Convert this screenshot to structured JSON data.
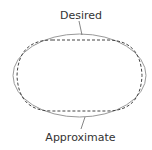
{
  "diagram": {
    "labels": {
      "desired": "Desired",
      "approximate": "Approximate"
    },
    "colors": {
      "desired_curve": "#999999",
      "approximate_curve": "#444444",
      "text": "#333333",
      "leader": "#666666"
    }
  }
}
